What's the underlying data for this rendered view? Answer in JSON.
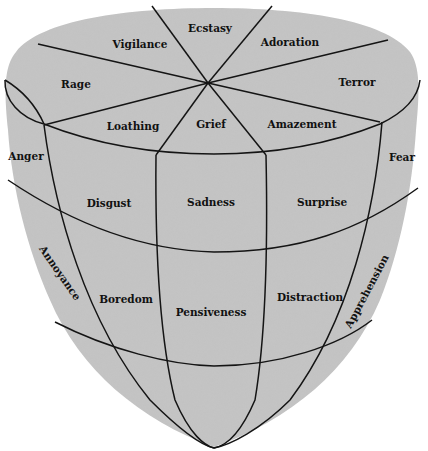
{
  "diagram": {
    "shape": "inverted cone / solid with eight wedges on top",
    "fill_color": "#c4c4c4",
    "line_color": "#141414",
    "background": "#ffffff",
    "top_face": {
      "outer_ring": [
        "Vigilance",
        "Ecstasy",
        "Adoration",
        "Terror",
        "Amazement",
        "Grief",
        "Loathing",
        "Rage"
      ]
    },
    "side_columns": {
      "left_edge": "Anger",
      "right_edge": "Fear",
      "front": [
        "Disgust",
        "Sadness",
        "Surprise"
      ]
    },
    "middle_band": {
      "left_edge": "Annoyance",
      "right_edge": "Apprehension",
      "front": [
        "Boredom",
        "Pensiveness",
        "Distraction"
      ]
    },
    "labels": {
      "vigilance": "Vigilance",
      "ecstasy": "Ecstasy",
      "adoration": "Adoration",
      "rage": "Rage",
      "terror": "Terror",
      "loathing": "Loathing",
      "grief": "Grief",
      "amazement": "Amazement",
      "anger": "Anger",
      "fear": "Fear",
      "disgust": "Disgust",
      "sadness": "Sadness",
      "surprise": "Surprise",
      "annoyance": "Annoyance",
      "apprehension": "Apprehension",
      "boredom": "Boredom",
      "pensiveness": "Pensiveness",
      "distraction": "Distraction"
    }
  }
}
